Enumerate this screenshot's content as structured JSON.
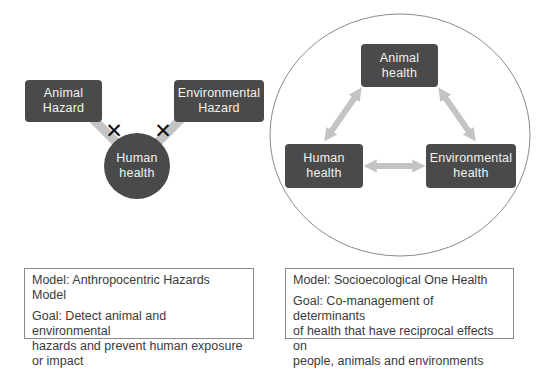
{
  "left_model": {
    "nodes": {
      "animal_hazard": "Animal\nHazard",
      "environmental_hazard": "Environmental\nHazard",
      "human_health": "Human\nhealth"
    },
    "blocked_marker": "✕",
    "caption": {
      "model": "Model: Anthropocentric Hazards Model",
      "goal": "Goal: Detect animal and environmental\nhazards and prevent human exposure\nor impact"
    }
  },
  "right_model": {
    "nodes": {
      "animal_health": "Animal\nhealth",
      "human_health": "Human\nhealth",
      "environmental_health": "Environmental\nhealth"
    },
    "caption": {
      "model": "Model: Socioecological One Health",
      "goal": "Goal: Co-management of determinants\nof health that have reciprocal effects on\npeople, animals and environments"
    }
  },
  "colors": {
    "node_fill": "#4a4a4a",
    "node_text": "#f2f2f2",
    "arrow": "#c4c4c4",
    "x_mark": "#111111",
    "outline": "#8a8a8a"
  }
}
